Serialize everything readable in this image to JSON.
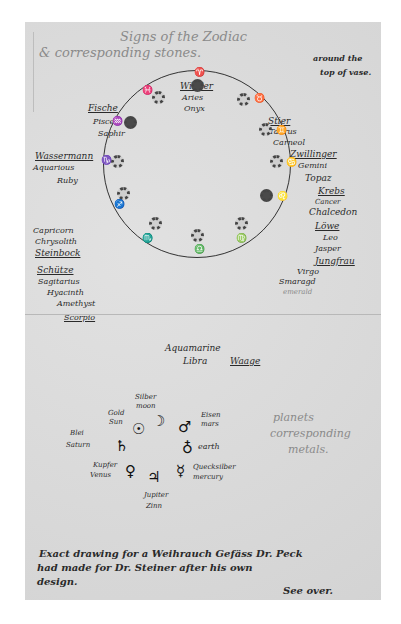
{
  "header": {
    "title_line1": "Signs of the Zodiac",
    "title_line2": "& corresponding stones.",
    "note_line1": "around the",
    "note_line2": "top of vase."
  },
  "zodiac": [
    {
      "german": "Widder",
      "latin": "Aries",
      "stone": "Onyx",
      "glyph": "♈"
    },
    {
      "german": "Stier",
      "latin": "Taurus",
      "stone": "Carneol",
      "glyph": "♉"
    },
    {
      "german": "Zwillinger",
      "latin": "Gemini",
      "stone": "Topaz",
      "glyph": "♊"
    },
    {
      "german": "Krebs",
      "latin": "Cancer",
      "stone": "Chalcedon",
      "glyph": "♋"
    },
    {
      "german": "Löwe",
      "latin": "Leo",
      "stone": "Jasper",
      "glyph": "♌"
    },
    {
      "german": "Jungfrau",
      "latin": "Virgo",
      "stone": "Smaragd",
      "stone_alt": "emerald",
      "glyph": "♍"
    },
    {
      "german": "Waage",
      "latin": "Libra",
      "stone": "Aquamarine",
      "glyph": "♎"
    },
    {
      "german": "",
      "latin": "Scorpio",
      "stone": "Amethyst",
      "glyph": "♏"
    },
    {
      "german": "Schütze",
      "latin": "Sagitarius",
      "stone": "Hyacinth",
      "glyph": "♐"
    },
    {
      "german": "Steinbock",
      "latin": "Capricorn",
      "stone": "Chrysolith",
      "glyph": "♑"
    },
    {
      "german": "Wassermann",
      "latin": "Aquarious",
      "stone": "Ruby",
      "glyph": "♒"
    },
    {
      "german": "Fische",
      "latin": "Pisces",
      "stone": "Saphir",
      "glyph": "♓"
    }
  ],
  "planets": {
    "note_line1": "planets",
    "note_line2": "corresponding",
    "note_line3": "metals.",
    "items": [
      {
        "metal_de": "Silber",
        "planet": "moon",
        "glyph": "☽"
      },
      {
        "metal_de": "Gold",
        "planet": "Sun",
        "glyph": "☉"
      },
      {
        "metal_de": "Eisen",
        "planet": "mars",
        "glyph": "♂"
      },
      {
        "metal_de": "Blei",
        "planet": "Saturn",
        "glyph": "♄"
      },
      {
        "metal_de": "",
        "planet": "earth",
        "glyph": "♁"
      },
      {
        "metal_de": "Kupfer",
        "planet": "Venus",
        "glyph": "♀"
      },
      {
        "metal_de": "Quecksilber",
        "planet": "mercury",
        "glyph": "☿"
      },
      {
        "metal_de": "Zinn",
        "planet": "Jupiter",
        "glyph": "♃"
      }
    ]
  },
  "footer": {
    "line1": "Exact drawing for a Weihrauch Gefäss Dr. Peck",
    "line2": "had made for Dr. Steiner after his own",
    "line3": "design.",
    "signature": "See over."
  }
}
